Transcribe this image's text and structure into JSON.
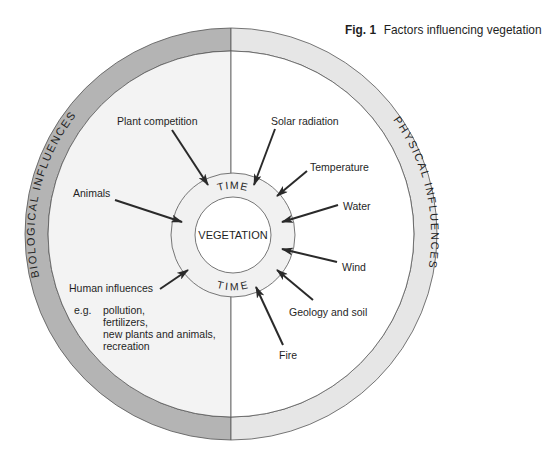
{
  "figure": {
    "number": "Fig. 1",
    "title": "Factors influencing vegetation"
  },
  "colors": {
    "biological_ring": "#b4b4b4",
    "physical_ring": "#e6e6e6",
    "biological_fill": "#f3f3f3",
    "physical_fill": "#ffffff",
    "time_ring_fill": "#f1f1f1",
    "stroke": "#555555",
    "arrow": "#2a2a2a"
  },
  "center": {
    "core_label": "VEGETATION",
    "time_top": "TIME",
    "time_bottom": "TIME"
  },
  "rings": {
    "left_label": "BIOLOGICAL INFLUENCES",
    "right_label": "PHYSICAL INFLUENCES"
  },
  "biological_factors": [
    {
      "label": "Plant competition"
    },
    {
      "label": "Animals"
    },
    {
      "label": "Human influences"
    }
  ],
  "human_examples": {
    "prefix": "e.g.",
    "lines": [
      "pollution,",
      "fertilizers,",
      "new plants and animals,",
      "recreation"
    ]
  },
  "physical_factors": [
    {
      "label": "Solar radiation"
    },
    {
      "label": "Temperature"
    },
    {
      "label": "Water"
    },
    {
      "label": "Wind"
    },
    {
      "label": "Geology and soil"
    },
    {
      "label": "Fire"
    }
  ]
}
